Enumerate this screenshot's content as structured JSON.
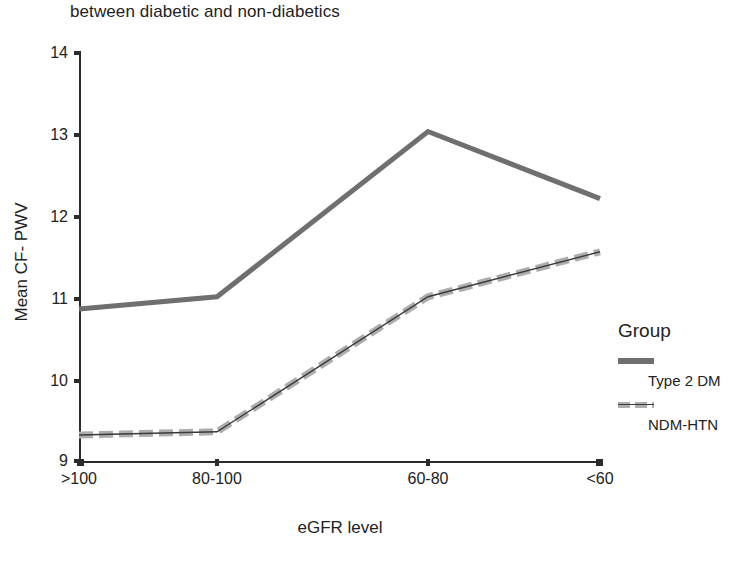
{
  "chart_data": {
    "type": "line",
    "title": "between diabetic and non-diabetics",
    "xlabel": "eGFR level",
    "ylabel": "Mean CF- PWV",
    "categories": [
      ">100",
      "80-100",
      "60-80",
      "<60"
    ],
    "ylim": [
      9,
      14
    ],
    "yticks": [
      "9",
      "10",
      "11",
      "12",
      "13",
      "14"
    ],
    "grid": false,
    "legend_position": "right",
    "legend_title": "Group",
    "series": [
      {
        "name": "Type 2 DM",
        "style": "solid",
        "color": "#6f6f6f",
        "values": [
          10.87,
          11.02,
          13.04,
          12.22
        ]
      },
      {
        "name": "NDM-HTN",
        "style": "dashed",
        "color": "#adadad",
        "values": [
          9.33,
          9.37,
          11.02,
          11.57
        ]
      }
    ]
  },
  "axes": {
    "y_tick_labels": [
      "14",
      "13",
      "12",
      "11",
      "10",
      "9"
    ],
    "x_tick_labels": [
      ">100",
      "80-100",
      "60-80",
      "<60"
    ]
  }
}
